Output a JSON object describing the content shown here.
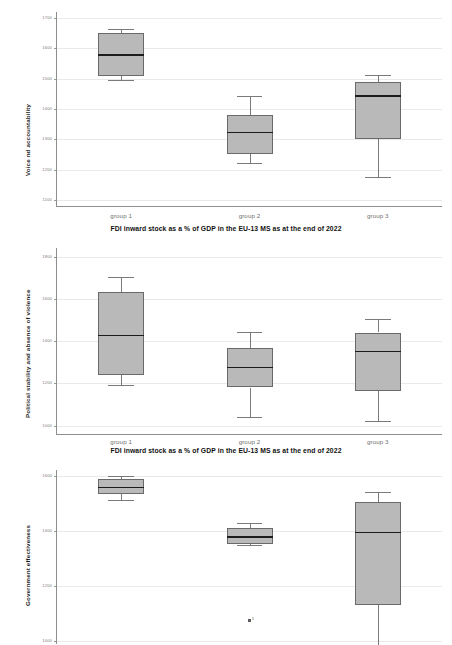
{
  "figure": {
    "type": "boxplot-figure",
    "panel_count": 3,
    "shared_xlabel": "FDI inward stock as a % of GDP in the EU-13 MS as at the end of 2022",
    "categories": [
      "group 1",
      "group 2",
      "group 3"
    ],
    "box_fill_color": "#b9b9b9",
    "box_edge_color": "#6a6a6a",
    "median_color": "#1c1c1c",
    "grid_color": "#e9e9ec",
    "axis_color": "#8e8e8e"
  },
  "chart_data": [
    {
      "type": "box",
      "title": "",
      "ylabel": "Voice nd accountability",
      "xlabel": "FDI inward stock as a % of GDP in the EU-13 MS as at the end of 2022",
      "categories": [
        "group 1",
        "group 2",
        "group 3"
      ],
      "ylim": [
        1080,
        1720
      ],
      "yticks": [
        1100,
        1200,
        1300,
        1400,
        1500,
        1600,
        1700
      ],
      "grid": true,
      "legend": "none",
      "boxes": [
        {
          "category": "group 1",
          "whisker_low": 1497,
          "q1": 1508,
          "median": 1578,
          "q3": 1650,
          "whisker_high": 1663,
          "outliers": []
        },
        {
          "category": "group 2",
          "whisker_low": 1222,
          "q1": 1251,
          "median": 1322,
          "q3": 1380,
          "whisker_high": 1443,
          "outliers": []
        },
        {
          "category": "group 3",
          "whisker_low": 1175,
          "q1": 1300,
          "median": 1443,
          "q3": 1488,
          "whisker_high": 1512,
          "outliers": []
        }
      ]
    },
    {
      "type": "box",
      "title": "",
      "ylabel": "Political stability and absence of violence",
      "xlabel": "FDI inward stock as a % of GDP in the EU-13 MS as at the end of 2022",
      "categories": [
        "group 1",
        "group 2",
        "group 3"
      ],
      "ylim": [
        960,
        1840
      ],
      "yticks": [
        1000,
        1200,
        1400,
        1600,
        1800
      ],
      "grid": true,
      "legend": "none",
      "boxes": [
        {
          "category": "group 1",
          "whisker_low": 1190,
          "q1": 1240,
          "median": 1425,
          "q3": 1630,
          "whisker_high": 1705,
          "outliers": []
        },
        {
          "category": "group 2",
          "whisker_low": 1043,
          "q1": 1180,
          "median": 1275,
          "q3": 1365,
          "whisker_high": 1445,
          "outliers": []
        },
        {
          "category": "group 3",
          "whisker_low": 1020,
          "q1": 1165,
          "median": 1350,
          "q3": 1440,
          "whisker_high": 1505,
          "outliers": []
        }
      ]
    },
    {
      "type": "box",
      "title": "",
      "ylabel": "Government effectiveness",
      "xlabel": "",
      "categories": [
        "group 1",
        "group 2",
        "group 3"
      ],
      "ylim": [
        990,
        1620
      ],
      "yticks": [
        1000,
        1200,
        1400,
        1600
      ],
      "grid": true,
      "legend": "none",
      "clipped_bottom": true,
      "boxes": [
        {
          "category": "group 1",
          "whisker_low": 1510,
          "q1": 1532,
          "median": 1556,
          "q3": 1588,
          "whisker_high": 1597,
          "outliers": []
        },
        {
          "category": "group 2",
          "whisker_low": 1348,
          "q1": 1352,
          "median": 1378,
          "q3": 1410,
          "whisker_high": 1430,
          "outliers": [
            {
              "value": 1075,
              "label": "1"
            }
          ]
        },
        {
          "category": "group 3",
          "whisker_low": 985,
          "q1": 1130,
          "median": 1393,
          "q3": 1505,
          "whisker_high": 1540,
          "outliers": []
        }
      ]
    }
  ]
}
